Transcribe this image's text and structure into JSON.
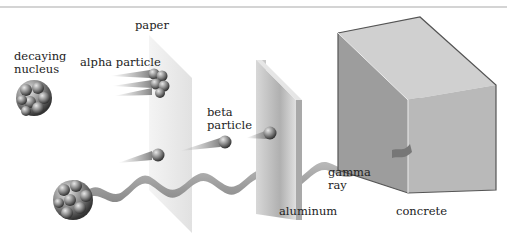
{
  "diagram": {
    "labels": {
      "decaying_nucleus_line1": "decaying",
      "decaying_nucleus_line2": "nucleus",
      "alpha_particle": "alpha particle",
      "paper": "paper",
      "beta_line1": "beta",
      "beta_line2": "particle",
      "gamma_line1": "gamma",
      "gamma_line2": "ray",
      "aluminum": "aluminum",
      "concrete": "concrete"
    },
    "colors": {
      "rule": "#d4d4d4",
      "paper": "#e6e6e6",
      "aluminum": "#bdbdbd",
      "concrete_front": "#b8b8b8",
      "concrete_top": "#d0d0d0",
      "concrete_side": "#9a9a9a",
      "particle": "#7a7a7a",
      "wave": "#9c9c9c"
    }
  }
}
